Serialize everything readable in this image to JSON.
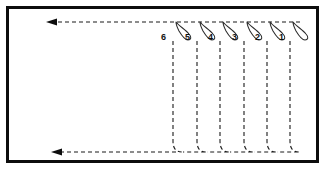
{
  "figure": {
    "type": "technical-line-diagram",
    "background_color": "#ffffff",
    "frame": {
      "border_color": "#0d0d0d",
      "border_width": 3,
      "x": 6,
      "y": 6,
      "width": 313,
      "height": 157
    },
    "line_color": "#1a1a1a",
    "dash_pattern": "4 3",
    "top_path": {
      "label": "top-dashed-flow-line",
      "y": 22,
      "x_start": 300,
      "x_end": 48,
      "arrow_direction": "left",
      "arrow_x": 48
    },
    "bottom_path": {
      "label": "bottom-dashed-flow-line",
      "y": 152,
      "x_start": 300,
      "x_end": 52,
      "arrow_direction": "left",
      "arrow_x": 52
    },
    "hooks": [
      {
        "id": "hook-6",
        "label": "6",
        "label_x": 163,
        "label_y": 38,
        "stem_x": 173,
        "hook_top_x": 176,
        "hook_apex_x": 190
      },
      {
        "id": "hook-5",
        "label": "5",
        "label_x": 187,
        "label_y": 38,
        "stem_x": 197,
        "hook_top_x": 200,
        "hook_apex_x": 214
      },
      {
        "id": "hook-4",
        "label": "4",
        "label_x": 210,
        "label_y": 38,
        "stem_x": 220,
        "hook_top_x": 223,
        "hook_apex_x": 237
      },
      {
        "id": "hook-3",
        "label": "3",
        "label_x": 234,
        "label_y": 38,
        "stem_x": 244,
        "hook_top_x": 247,
        "hook_apex_x": 261
      },
      {
        "id": "hook-2",
        "label": "2",
        "label_x": 257,
        "label_y": 38,
        "stem_x": 267,
        "hook_top_x": 270,
        "hook_apex_x": 284
      },
      {
        "id": "hook-1",
        "label": "1",
        "label_x": 281,
        "label_y": 38,
        "stem_x": 290,
        "hook_top_x": 293,
        "hook_apex_x": 306
      }
    ],
    "hook_count": 6,
    "labels_order": [
      "6",
      "5",
      "4",
      "3",
      "2",
      "1"
    ]
  }
}
